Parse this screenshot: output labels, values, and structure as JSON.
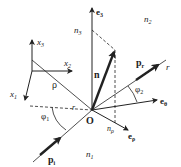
{
  "diagram": {
    "type": "reflection-geometry",
    "labels": {
      "e3": "e",
      "e3_sub": "3",
      "n3": "n",
      "n3_sub": "3",
      "n2": "n",
      "n2_sub": "2",
      "n": "n",
      "pr": "p",
      "pr_sub": "r",
      "r_upper": "r",
      "phi2": "φ",
      "phi2_sub": "2",
      "e_theta": "e",
      "e_theta_sub": "θ",
      "x3": "x",
      "x3_sub": "3",
      "x2": "x",
      "x2_sub": "2",
      "x1": "x",
      "x1_sub": "1",
      "rho": "ρ",
      "r_left": "r",
      "phi1": "φ",
      "phi1_sub": "1",
      "O": "O",
      "n_rho": "n",
      "n_rho_sub": "ρ",
      "e_rho": "e",
      "e_rho_sub": "ρ",
      "pi": "p",
      "pi_sub": "i",
      "n1": "n",
      "n1_sub": "1"
    },
    "colors": {
      "line": "#222222",
      "background": "#ffffff"
    }
  }
}
